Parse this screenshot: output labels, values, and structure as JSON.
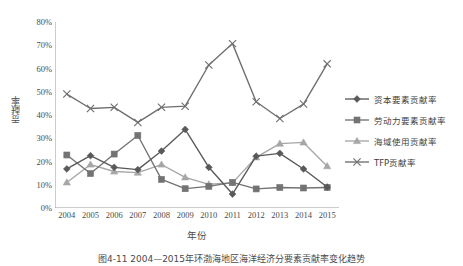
{
  "chart_data": {
    "type": "line",
    "title": "",
    "xlabel": "年份",
    "ylabel": "贡献率",
    "categories": [
      "2004",
      "2005",
      "2006",
      "2007",
      "2008",
      "2009",
      "2010",
      "2011",
      "2012",
      "2013",
      "2014",
      "2015"
    ],
    "x": [
      2004,
      2005,
      2006,
      2007,
      2008,
      2009,
      2010,
      2011,
      2012,
      2013,
      2014,
      2015
    ],
    "ylim": [
      0,
      80
    ],
    "ytick_labels": [
      "0%",
      "10%",
      "20%",
      "30%",
      "40%",
      "50%",
      "60%",
      "70%",
      "80%"
    ],
    "ytick_values": [
      0,
      10,
      20,
      30,
      40,
      50,
      60,
      70,
      80
    ],
    "grid": false,
    "legend_position": "right",
    "series": [
      {
        "name": "资本要素贡献率",
        "marker": "diamond",
        "color": "#595959",
        "values": [
          16.8,
          22.5,
          17.5,
          16.5,
          24.5,
          33.8,
          17.5,
          6.0,
          22.3,
          23.5,
          16.8,
          9.0
        ]
      },
      {
        "name": "劳动力要素贡献率",
        "marker": "square",
        "color": "#737373",
        "values": [
          22.8,
          14.8,
          23.2,
          31.2,
          12.3,
          8.3,
          9.3,
          11.0,
          8.2,
          8.8,
          8.6,
          8.8
        ]
      },
      {
        "name": "海域使用贡献率",
        "marker": "triangle",
        "color": "#a6a6a6",
        "values": [
          11.0,
          18.7,
          15.7,
          15.2,
          18.7,
          13.2,
          10.2,
          10.8,
          21.8,
          27.7,
          28.2,
          18.0
        ]
      },
      {
        "name": "TFP贡献率",
        "marker": "cross",
        "color": "#6e6e6e",
        "values": [
          49.0,
          42.8,
          43.3,
          36.8,
          43.3,
          43.8,
          61.5,
          70.7,
          45.7,
          38.5,
          44.7,
          62.0
        ]
      }
    ]
  },
  "caption": "图4-11  2004—2015年环渤海地区海洋经济分要素贡献率变化趋势",
  "legend": {
    "items": [
      {
        "label": "资本要素贡献率"
      },
      {
        "label": "劳动力要素贡献率"
      },
      {
        "label": "海域使用贡献率"
      },
      {
        "label": "TFP贡献率"
      }
    ]
  }
}
